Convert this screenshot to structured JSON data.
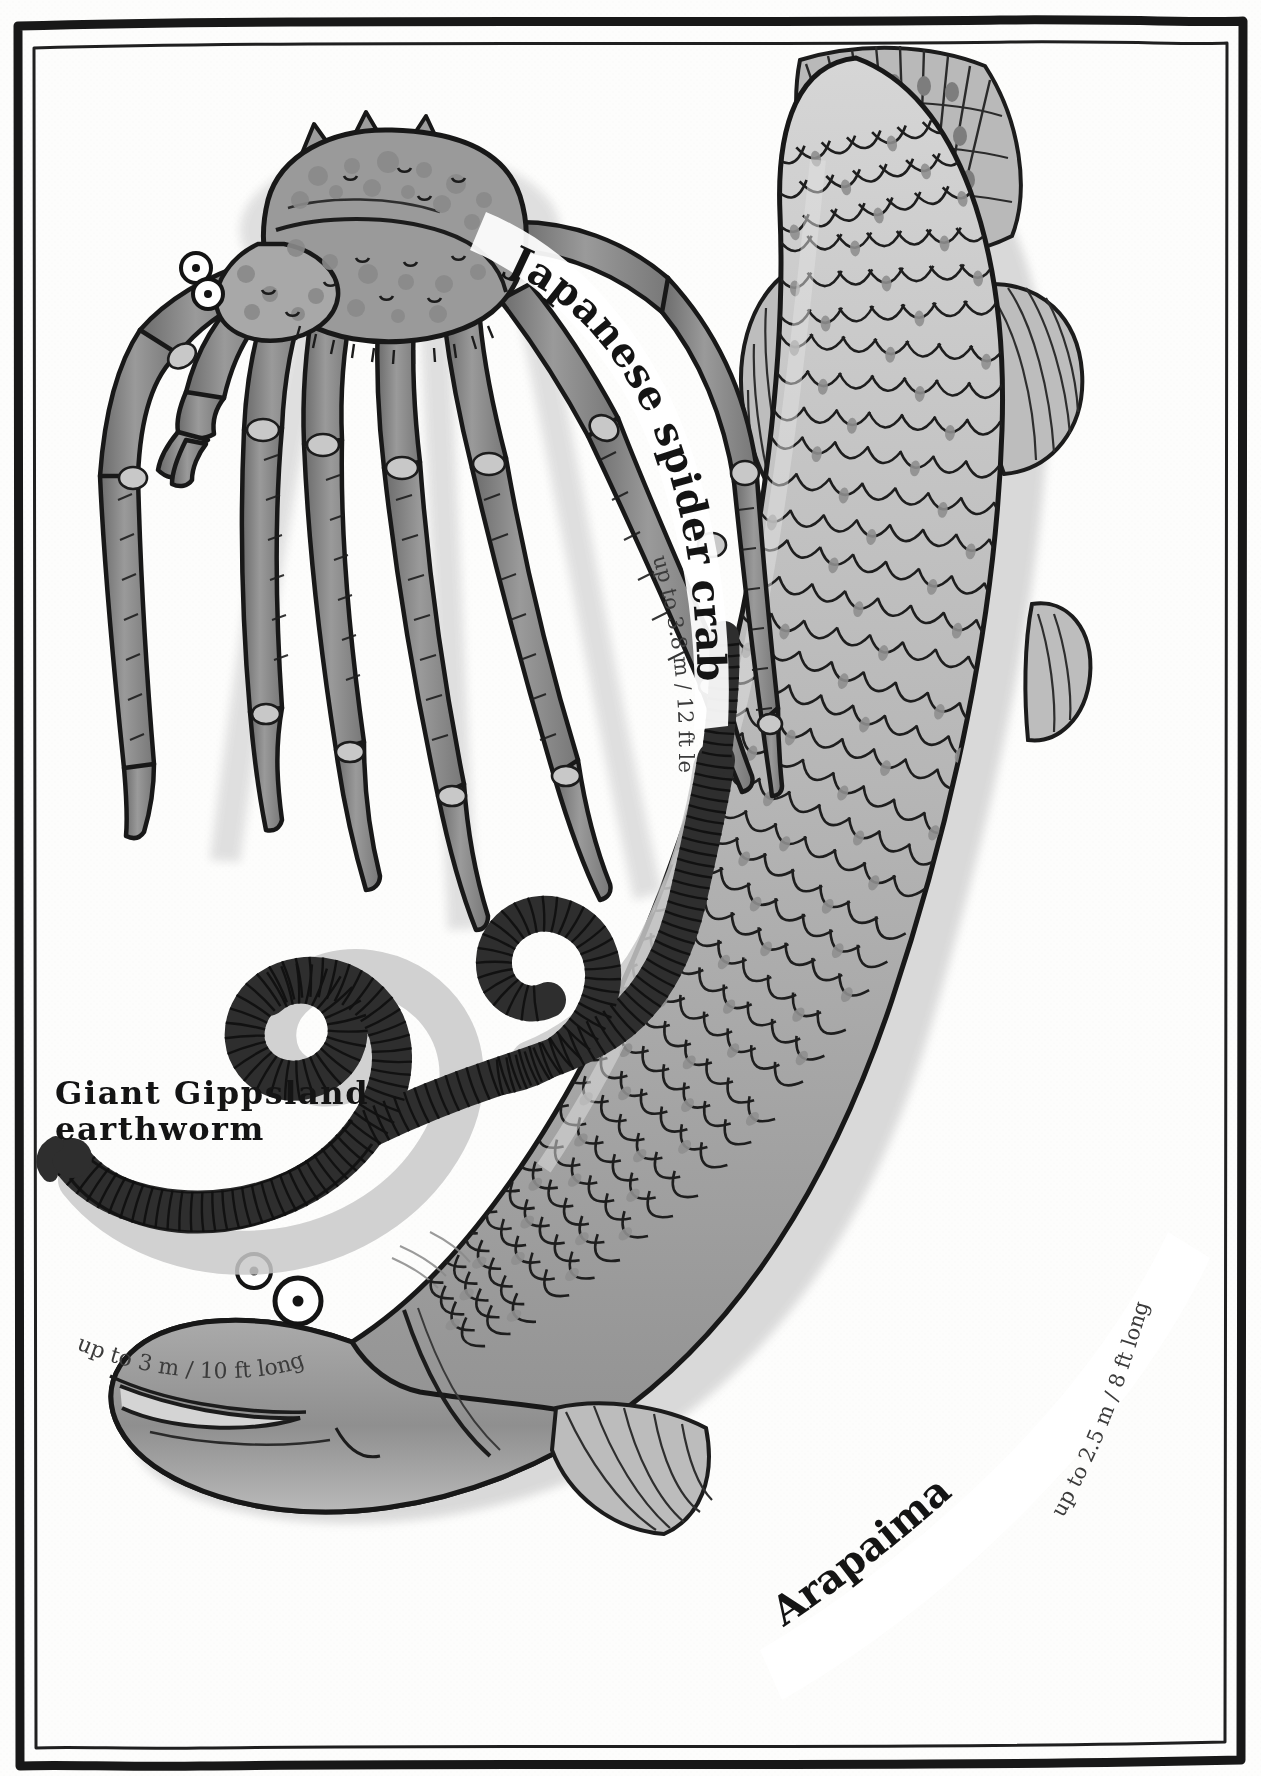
{
  "page": {
    "running_head": "The giants",
    "page_number": "76",
    "background_color": "#fdfdfc",
    "ink_color": "#1a1a1a"
  },
  "creatures": [
    {
      "id": "japanese-spider-crab",
      "name": "Japanese spider crab",
      "measurement": "up to 3.8 m / 12 ft legspan",
      "label_style": "curved-bold-serif",
      "body_color": "#8e8e8e",
      "shade_color": "#6f6f6f"
    },
    {
      "id": "giant-gippsland-earthworm",
      "name": "Giant Gippsland\nearthworm",
      "name_line1": "Giant Gippsland",
      "name_line2": "earthworm",
      "measurement": "up to 3 m / 10 ft long",
      "label_style": "straight-bold-serif",
      "body_color": "#3a3a3a",
      "shade_color": "#9a9a9a"
    },
    {
      "id": "arapaima",
      "name": "Arapaima",
      "measurement": "up to 2.5 m / 8 ft long",
      "label_style": "curved-bold-serif",
      "body_color": "#b4b4b4",
      "shade_color": "#8a8a8a"
    }
  ],
  "icons": {
    "frame": "hand-drawn-double-border",
    "crab": "japanese-spider-crab-illustration",
    "worm": "giant-gippsland-earthworm-illustration",
    "fish": "arapaima-fish-illustration"
  }
}
